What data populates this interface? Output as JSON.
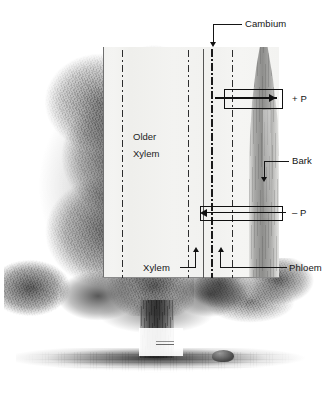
{
  "figure": {
    "width": 332,
    "height": 400,
    "background_color": "#ffffff",
    "ink_color": "#141414"
  },
  "illustration": {
    "subject": "broadleaf-tree-engraving",
    "parts": [
      {
        "name": "canopy",
        "description": "dense stippled foliage crown, left half"
      },
      {
        "name": "trunk",
        "description": "short dark trunk at base centre"
      },
      {
        "name": "ground",
        "description": "shaded ground line with small rock at right"
      }
    ]
  },
  "panel": {
    "name": "trunk-cross-section-panel",
    "description": "white cut-away rectangle revealing the trunk's internal tissue layers",
    "zones": [
      {
        "id": "older-xylem",
        "label_line_1": "Older",
        "label_line_2": "Xylem"
      },
      {
        "id": "xylem",
        "label": "Xylem"
      },
      {
        "id": "cambium",
        "label": "Cambium"
      },
      {
        "id": "phloem",
        "label": "Phloem"
      },
      {
        "id": "bark",
        "label": "Bark"
      }
    ]
  },
  "labels": {
    "cambium": "Cambium",
    "bark": "Bark",
    "phloem": "Phloem",
    "xylem": "Xylem",
    "older_xylem_line1": "Older",
    "older_xylem_line2": "Xylem",
    "positive_pressure": "+ P",
    "negative_pressure": "– P"
  },
  "flux": {
    "positive": {
      "label": "+ P",
      "direction": "right",
      "meaning": "positive pressure flow outward through phloem / bark",
      "arrow_icon": "arrow-right-icon"
    },
    "negative": {
      "label": "– P",
      "direction": "left",
      "meaning": "negative pressure flow inward through xylem",
      "arrow_icon": "arrow-left-icon"
    }
  },
  "leaders": [
    {
      "target": "cambium",
      "arrow_icon": "arrow-down-icon"
    },
    {
      "target": "bark",
      "arrow_icon": "arrow-down-icon"
    },
    {
      "target": "xylem",
      "arrow_icon": "arrow-up-icon"
    },
    {
      "target": "phloem",
      "arrow_icon": "arrow-up-icon"
    }
  ],
  "colors": {
    "ink": "#141414",
    "panel_fill": "#f3f3f1",
    "bark_gray": "#888886",
    "cambium_dark": "#1a1a1a"
  }
}
